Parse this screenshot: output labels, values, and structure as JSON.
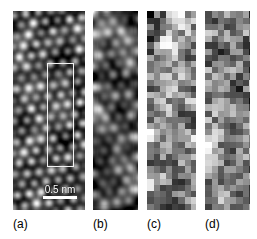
{
  "figure": {
    "background_color": "#ffffff",
    "width": 257,
    "height": 239,
    "kind": "microscopy-image-panel-series"
  },
  "panels": [
    {
      "id": "a",
      "label": "(a)",
      "x": 13,
      "y": 11,
      "width": 72,
      "height": 199,
      "texture": "hexagonal-lattice",
      "description": "high-resolution atomic lattice of bright spots",
      "lattice_spacing_px": 12.2,
      "blur_px": 1.6,
      "noise": 0.07,
      "brightness": 0.46,
      "contrast": 1.0,
      "label_x": 13,
      "label_y": 217
    },
    {
      "id": "b",
      "label": "(b)",
      "x": 93,
      "y": 11,
      "width": 45,
      "height": 199,
      "texture": "hexagonal-lattice",
      "description": "blurred low-resolution lattice",
      "lattice_spacing_px": 12.2,
      "blur_px": 4.2,
      "noise": 0.05,
      "brightness": 0.42,
      "contrast": 1.15,
      "label_x": 93,
      "label_y": 217
    },
    {
      "id": "c",
      "label": "(c)",
      "x": 147,
      "y": 11,
      "width": 49,
      "height": 199,
      "texture": "pixel-blocks",
      "description": "coarse pixelated random grayscale blocks",
      "block_px": 6.2,
      "noise": 1.0,
      "brightness": 0.5,
      "contrast": 1.0,
      "label_x": 147,
      "label_y": 217
    },
    {
      "id": "d",
      "label": "(d)",
      "x": 205,
      "y": 11,
      "width": 45,
      "height": 199,
      "texture": "pixel-blocks",
      "description": "coarse pixelated random grayscale blocks",
      "block_px": 6.2,
      "noise": 1.0,
      "brightness": 0.52,
      "contrast": 0.95,
      "label_x": 205,
      "label_y": 217
    }
  ],
  "roi_rect": {
    "name": "region-of-interest",
    "x": 47,
    "y": 63,
    "width": 27,
    "height": 104,
    "color": "#f2f2f2"
  },
  "scale_bar": {
    "label": "0.5 nm",
    "x": 41,
    "y": 184,
    "width": 38,
    "bar_length_px": 34,
    "bar_thickness_px": 3,
    "color": "#ffffff"
  }
}
